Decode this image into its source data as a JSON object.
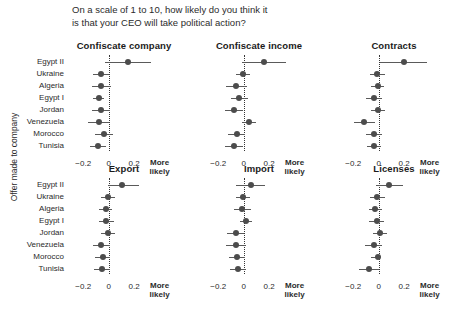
{
  "chart_data": {
    "type": "scatter",
    "title": "On a scale of 1 to 10, how likely do you think it\nis that your CEO will take political action?",
    "ylabel": "Offer made to company",
    "xlabel": "",
    "xlim": [
      -0.32,
      0.56
    ],
    "xticks": [
      -0.2,
      0,
      0.2
    ],
    "xtick_labels": [
      "−0.2",
      "0",
      "0.2"
    ],
    "x_end_label": "More\nlikely",
    "grid": false,
    "legend": "none",
    "zero_reference_line": 0,
    "categories": [
      "Egypt II",
      "Ukraine",
      "Algeria",
      "Egypt I",
      "Jordan",
      "Venezuela",
      "Morocco",
      "Tunisia"
    ],
    "panels": [
      {
        "title": "Confiscate company",
        "row": 0,
        "col": 0,
        "values": [
          0.148,
          -0.06,
          -0.058,
          -0.08,
          -0.06,
          -0.08,
          -0.04,
          -0.086
        ],
        "ci_low": [
          -0.028,
          -0.122,
          -0.134,
          -0.122,
          -0.128,
          -0.16,
          -0.104,
          -0.15
        ],
        "ci_high": [
          0.33,
          0.002,
          0.02,
          -0.034,
          0.01,
          0.0,
          0.03,
          -0.022
        ]
      },
      {
        "title": "Confiscate income",
        "row": 0,
        "col": 1,
        "values": [
          0.16,
          -0.004,
          -0.058,
          -0.036,
          -0.076,
          0.044,
          -0.056,
          -0.076
        ],
        "ci_low": [
          -0.01,
          -0.06,
          -0.14,
          -0.1,
          -0.15,
          -0.012,
          -0.124,
          -0.146
        ],
        "ci_high": [
          0.33,
          0.05,
          0.022,
          0.03,
          -0.004,
          0.1,
          0.012,
          -0.008
        ]
      },
      {
        "title": "Contracts",
        "row": 0,
        "col": 2,
        "values": [
          0.196,
          -0.01,
          -0.008,
          -0.036,
          -0.006,
          -0.114,
          -0.036,
          -0.034
        ],
        "ci_low": [
          0.012,
          -0.066,
          -0.058,
          -0.1,
          -0.064,
          -0.196,
          -0.1,
          -0.09
        ],
        "ci_high": [
          0.378,
          0.046,
          0.04,
          0.026,
          0.05,
          -0.03,
          0.026,
          0.02
        ]
      },
      {
        "title": "Export",
        "row": 1,
        "col": 0,
        "values": [
          0.106,
          -0.008,
          -0.024,
          -0.018,
          -0.006,
          -0.058,
          -0.046,
          -0.054
        ],
        "ci_low": [
          -0.002,
          -0.064,
          -0.076,
          -0.074,
          -0.062,
          -0.124,
          -0.106,
          -0.116
        ],
        "ci_high": [
          0.236,
          0.048,
          0.028,
          0.038,
          0.052,
          0.01,
          0.012,
          0.01
        ]
      },
      {
        "title": "Import",
        "row": 1,
        "col": 1,
        "values": [
          0.054,
          -0.002,
          -0.012,
          0.016,
          -0.06,
          -0.058,
          -0.05,
          -0.046
        ],
        "ci_low": [
          -0.06,
          -0.058,
          -0.076,
          -0.032,
          -0.13,
          -0.138,
          -0.116,
          -0.11
        ],
        "ci_high": [
          0.168,
          0.046,
          0.054,
          0.066,
          0.006,
          0.018,
          0.014,
          0.014
        ]
      },
      {
        "title": "Licenses",
        "row": 1,
        "col": 2,
        "values": [
          0.084,
          -0.01,
          -0.026,
          -0.016,
          0.008,
          -0.036,
          -0.006,
          -0.076
        ],
        "ci_low": [
          -0.024,
          -0.068,
          -0.078,
          -0.078,
          -0.044,
          -0.104,
          -0.06,
          -0.156
        ],
        "ci_high": [
          0.188,
          0.046,
          0.026,
          0.042,
          0.062,
          0.028,
          0.01,
          0.002
        ]
      }
    ]
  }
}
